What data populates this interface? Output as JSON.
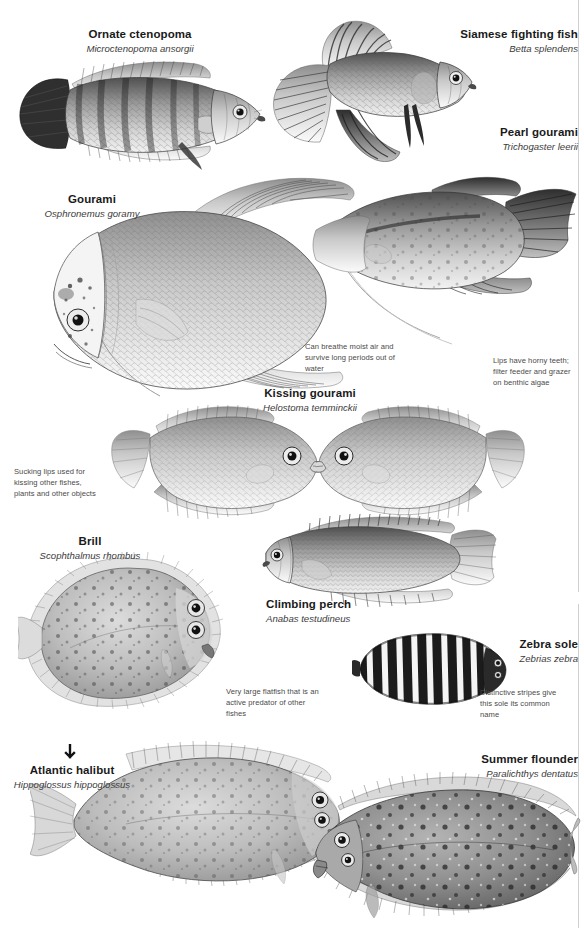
{
  "page": {
    "background_color": "#ffffff",
    "width": 584,
    "height": 928
  },
  "species": [
    {
      "id": "ornate-ctenopoma",
      "common": "Ornate ctenopoma",
      "scientific": "Microctenopoma ansorgii"
    },
    {
      "id": "siamese-fighting-fish",
      "common": "Siamese fighting fish",
      "scientific": "Betta splendens"
    },
    {
      "id": "pearl-gourami",
      "common": "Pearl gourami",
      "scientific": "Trichogaster leerii"
    },
    {
      "id": "gourami",
      "common": "Gourami",
      "scientific": "Osphronemus goramy"
    },
    {
      "id": "kissing-gourami",
      "common": "Kissing gourami",
      "scientific": "Helostoma temminckii"
    },
    {
      "id": "climbing-perch",
      "common": "Climbing perch",
      "scientific": "Anabas testudineus"
    },
    {
      "id": "brill",
      "common": "Brill",
      "scientific": "Scophthalmus rhombus"
    },
    {
      "id": "zebra-sole",
      "common": "Zebra sole",
      "scientific": "Zebrias zebra"
    },
    {
      "id": "atlantic-halibut",
      "common": "Atlantic halibut",
      "scientific": "Hippoglossus hippoglossus"
    },
    {
      "id": "summer-flounder",
      "common": "Summer flounder",
      "scientific": "Paralichthys dentatus"
    }
  ],
  "notes": {
    "gourami_air": "Can breathe moist air and survive long periods out of water",
    "pearl_lips": "Lips have horny teeth; filter feeder and grazer on benthic algae",
    "kissing_lips": "Sucking lips used for kissing other fishes, plants and other objects",
    "halibut_predator": "Very large flatfish that is an active predator of other fishes",
    "zebra_stripes": "Distinctive stripes give this sole its common name"
  },
  "colors": {
    "text": "#1a1a1a",
    "scientific_text": "#3b3b3b",
    "note_text": "#4a4a4a",
    "rule": "#cfcfcf",
    "illustration_dark": "#2b2b2b",
    "illustration_mid": "#8c8c8c",
    "illustration_light": "#d9d9d9"
  }
}
